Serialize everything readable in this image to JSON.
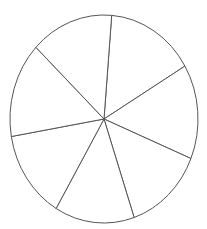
{
  "chart_data": {
    "type": "pie",
    "title": "",
    "labels": [
      "",
      "",
      "",
      "",
      "",
      "",
      ""
    ],
    "values": [
      15.2,
      14.7,
      13.6,
      13.7,
      13.8,
      14.8,
      14.2
    ],
    "start_angle_deg": 4.7,
    "direction": "clockwise",
    "legend": "none",
    "fill_color": "#ffffff",
    "stroke_color": "#555555"
  },
  "geometry": {
    "cx": 104,
    "cy": 119,
    "rx": 94,
    "ry": 104
  }
}
